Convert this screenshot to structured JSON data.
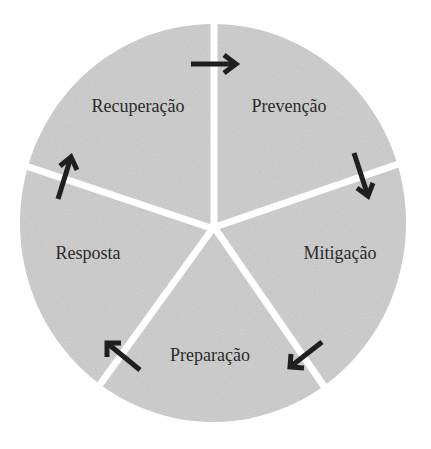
{
  "diagram": {
    "type": "cycle",
    "colors": {
      "background": "#ffffff",
      "segment_fill": "#d3d3d3",
      "divider": "#ffffff",
      "arrow": "#1f1f1f",
      "text": "#2b2b2b"
    },
    "segments": [
      {
        "label": "Prevenção"
      },
      {
        "label": "Mitigação"
      },
      {
        "label": "Preparação"
      },
      {
        "label": "Resposta"
      },
      {
        "label": "Recuperação"
      }
    ],
    "arrows": [
      {
        "from": "Recuperação",
        "to": "Prevenção"
      },
      {
        "from": "Prevenção",
        "to": "Mitigação"
      },
      {
        "from": "Mitigação",
        "to": "Preparação"
      },
      {
        "from": "Preparação",
        "to": "Resposta"
      },
      {
        "from": "Resposta",
        "to": "Recuperação"
      }
    ]
  }
}
